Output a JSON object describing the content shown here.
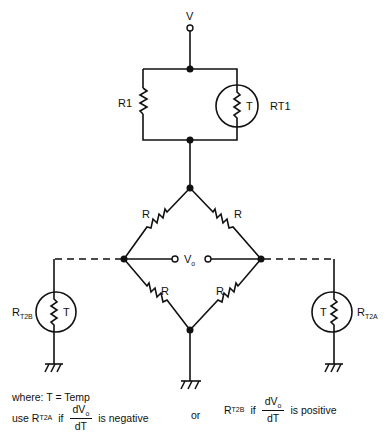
{
  "diagram": {
    "labels": {
      "supply": "V",
      "r1": "R1",
      "rt1": "RT1",
      "thermistor_symbol": "T",
      "bridge_resistor": "R",
      "output": "V",
      "output_sub": "o",
      "rt2b": "R",
      "rt2b_sub": "T2B",
      "rt2a": "R",
      "rt2a_sub": "T2A"
    },
    "components": [
      {
        "id": "R1",
        "type": "resistor"
      },
      {
        "id": "RT1",
        "type": "thermistor"
      },
      {
        "id": "R_top_left",
        "type": "resistor",
        "label": "R"
      },
      {
        "id": "R_top_right",
        "type": "resistor",
        "label": "R"
      },
      {
        "id": "R_bottom_left",
        "type": "resistor",
        "label": "R"
      },
      {
        "id": "R_bottom_right",
        "type": "resistor",
        "label": "R"
      },
      {
        "id": "RT2B",
        "type": "thermistor"
      },
      {
        "id": "RT2A",
        "type": "thermistor"
      }
    ]
  },
  "notes": {
    "where": "where: T = Temp",
    "use": "use R",
    "use_sub": "T2A",
    "if1": "if",
    "frac_num": "dV",
    "frac_num_sub": "o",
    "frac_den": "dT",
    "negative": "is negative",
    "or": "or",
    "r2b": "R",
    "r2b_sub": "T2B",
    "if2": "if",
    "positive": "is positive"
  }
}
